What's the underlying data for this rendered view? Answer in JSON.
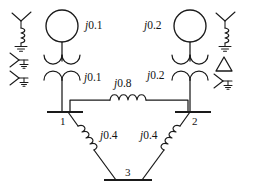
{
  "diagram": {
    "type": "power-system-one-line",
    "stroke_color": "#1a1a1a",
    "background_color": "#ffffff"
  },
  "buses": [
    {
      "id": "bus1",
      "label": "1"
    },
    {
      "id": "bus2",
      "label": "2"
    },
    {
      "id": "bus3",
      "label": "3"
    }
  ],
  "generators": [
    {
      "id": "gen1",
      "reactance_label": "j0.1",
      "j": "j",
      "value": "0.1",
      "side": "left"
    },
    {
      "id": "gen2",
      "reactance_label": "j0.2",
      "j": "j",
      "value": "0.2",
      "side": "right"
    }
  ],
  "transformers": [
    {
      "id": "xfmr1",
      "reactance_label": "j0.1",
      "j": "j",
      "value": "0.1",
      "side": "left"
    },
    {
      "id": "xfmr2",
      "reactance_label": "j0.2",
      "j": "j",
      "value": "0.2",
      "side": "right"
    }
  ],
  "lines": [
    {
      "id": "line-1-2",
      "from": "1",
      "to": "2",
      "reactance_label": "j0.8",
      "j": "j",
      "value": "0.8"
    },
    {
      "id": "line-1-3",
      "from": "1",
      "to": "3",
      "reactance_label": "j0.4",
      "j": "j",
      "value": "0.4"
    },
    {
      "id": "line-2-3",
      "from": "2",
      "to": "3",
      "reactance_label": "j0.4",
      "j": "j",
      "value": "0.4"
    }
  ],
  "legend_symbols": [
    {
      "id": "sym-wye-reactor-left",
      "name": "wye-grounded-through-reactor",
      "position": "top-left"
    },
    {
      "id": "sym-wye-ground-left-1",
      "name": "wye-solidly-grounded",
      "position": "mid-left-upper"
    },
    {
      "id": "sym-wye-ground-left-2",
      "name": "wye-solidly-grounded",
      "position": "mid-left-lower"
    },
    {
      "id": "sym-wye-reactor-right",
      "name": "wye-grounded-through-reactor",
      "position": "top-right"
    },
    {
      "id": "sym-delta-right",
      "name": "delta-connection",
      "position": "mid-right-upper"
    },
    {
      "id": "sym-wye-ground-right",
      "name": "wye-solidly-grounded",
      "position": "mid-right-lower"
    }
  ],
  "labels": {
    "gen1_reactance": "j0.1",
    "gen2_reactance": "j0.2",
    "xfmr1_reactance": "j0.1",
    "xfmr2_reactance": "j0.2",
    "line12_reactance": "j0.8",
    "line13_reactance": "j0.4",
    "line23_reactance": "j0.4",
    "bus1": "1",
    "bus2": "2",
    "bus3": "3"
  }
}
